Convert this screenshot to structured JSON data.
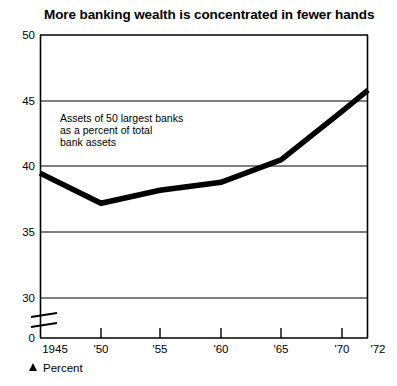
{
  "chart_data": {
    "type": "line",
    "title": "More banking wealth is  concentrated in fewer hands",
    "xlabel": "",
    "ylabel": "",
    "x": [
      1945,
      1950,
      1955,
      1960,
      1965,
      1970,
      1972
    ],
    "categories": [
      "1945",
      "'50",
      "'55",
      "'60",
      "'65",
      "'70",
      "'72"
    ],
    "values": [
      39.5,
      37.2,
      38.2,
      38.8,
      40.5,
      44.2,
      45.8
    ],
    "series": [
      {
        "name": "Assets of 50 largest banks as a percent of total bank assets",
        "values": [
          39.5,
          37.2,
          38.2,
          38.8,
          40.5,
          44.2,
          45.8
        ]
      }
    ],
    "ylim": [
      30,
      50
    ],
    "yticks": [
      30,
      35,
      40,
      45,
      50
    ],
    "ytick_labels": [
      "30",
      "35",
      "40",
      "45",
      "50"
    ],
    "zero_tick_label": "0",
    "axis_break": true,
    "xtick_labels": [
      "1945",
      "'50",
      "'55",
      "'60",
      "'65",
      "'70",
      "'72"
    ],
    "grid": true,
    "grid_orientation": "horizontal",
    "legend_position": "none",
    "line_color": "#000000",
    "line_width_px": 5,
    "annotations": [
      {
        "name": "series-annotation",
        "lines": [
          "Assets of 50 largest banks",
          "as a percent of total",
          "bank assets"
        ]
      }
    ],
    "footnote": {
      "marker": "triangle-up",
      "label": "Percent"
    }
  },
  "colors": {
    "background": "#ffffff",
    "ink": "#000000",
    "grid": "#000000"
  }
}
